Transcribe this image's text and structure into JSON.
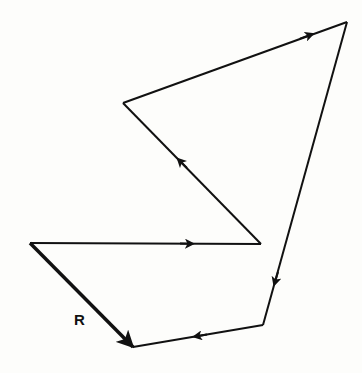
{
  "diagram": {
    "stroke_color": "#111111",
    "background": "#fdfdfb",
    "vectors": [
      {
        "name": "v1",
        "from": [
          30,
          243
        ],
        "to": [
          261,
          244
        ],
        "arrow_at": [
          190,
          243.7
        ]
      },
      {
        "name": "v2",
        "from": [
          261,
          244
        ],
        "to": [
          123,
          103
        ],
        "arrow_at": [
          180,
          161
        ]
      },
      {
        "name": "v3",
        "from": [
          123,
          103
        ],
        "to": [
          347,
          22
        ],
        "arrow_at": [
          310,
          35
        ]
      },
      {
        "name": "v4",
        "from": [
          347,
          22
        ],
        "to": [
          263,
          325
        ],
        "arrow_at": [
          275,
          282
        ]
      },
      {
        "name": "v5",
        "from": [
          263,
          325
        ],
        "to": [
          133,
          347
        ],
        "arrow_at": [
          197,
          336
        ]
      }
    ],
    "resultant": {
      "label": "R",
      "from": [
        30,
        243
      ],
      "to": [
        133,
        347
      ]
    }
  }
}
